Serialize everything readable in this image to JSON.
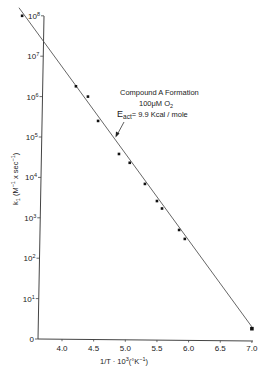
{
  "chart_data": {
    "type": "scatter",
    "title": "",
    "xlabel": "1/T · 10³(°K⁻¹)",
    "ylabel": "k₁ (M⁻¹ x sec⁻¹)",
    "yscale": "log",
    "xlim": [
      3.6,
      7.0
    ],
    "ylim": [
      1,
      100000000
    ],
    "grid": false,
    "x_ticks": [
      "4.0",
      "4.5",
      "5.0",
      "5.5",
      "6.0",
      "6.5",
      "7.0"
    ],
    "x_tick_values": [
      4.0,
      4.5,
      5.0,
      5.5,
      6.0,
      6.5,
      7.0
    ],
    "y_ticks": [
      "0",
      "10¹",
      "10²",
      "10³",
      "10⁴",
      "10⁵",
      "10⁶",
      "10⁷",
      "10⁸"
    ],
    "y_tick_exponents": [
      0,
      1,
      2,
      3,
      4,
      5,
      6,
      7,
      8
    ],
    "series": [
      {
        "name": "Compound A Formation",
        "x": [
          3.37,
          4.22,
          4.41,
          4.57,
          4.9,
          5.07,
          5.31,
          5.5,
          5.58,
          5.85,
          5.94,
          7.0
        ],
        "y": [
          100000000,
          1800000,
          1000000,
          250000,
          38000,
          23000,
          6900,
          2600,
          1700,
          500,
          300,
          1.8
        ]
      }
    ],
    "fit_line": {
      "x": [
        3.32,
        7.0
      ],
      "log10_y": [
        8.2,
        0.3
      ]
    },
    "annotations": [
      {
        "text": "Compound A Formation",
        "line": 1
      },
      {
        "text": "100μM O₂",
        "line": 2
      },
      {
        "text": "E_act = 9.9 Kcal/mole",
        "line": 3
      }
    ]
  },
  "labels": {
    "annotation_line1": "Compound A Formation",
    "annotation_line2_main": "100μM O",
    "annotation_line2_sub": "2",
    "annotation_line3_e": "E",
    "annotation_line3_sub": "act",
    "annotation_line3_rest": "= 9.9 Kcal / mole",
    "xlabel_main": "1/T · 10",
    "xlabel_sup": "3",
    "xlabel_tail": "(°K",
    "xlabel_sup2": "−1",
    "xlabel_close": ")",
    "ylabel_main": "k",
    "ylabel_sub": "1",
    "ylabel_rest": " (M",
    "ylabel_sup1": "−1",
    "ylabel_mid": " x sec",
    "ylabel_sup2": "−1",
    "ylabel_close": ")",
    "ytick_base": "10",
    "ytick_zero": "0"
  }
}
